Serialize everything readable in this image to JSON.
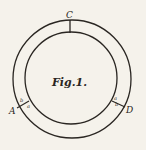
{
  "figure": {
    "caption": "Fig.1.",
    "labels": {
      "top": "C",
      "left": "A",
      "right": "D",
      "left_inner_b": "b",
      "left_inner_a": "a",
      "right_inner_a": "a",
      "right_inner_b": "b"
    },
    "colors": {
      "ink": "#2a2622",
      "paper": "#f5f2eb"
    }
  }
}
